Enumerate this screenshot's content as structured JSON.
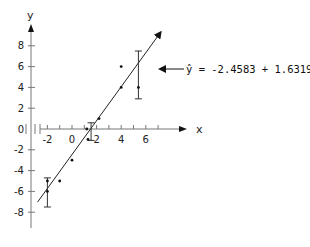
{
  "chart_data": {
    "type": "scatter",
    "title": "",
    "xlabel": "x",
    "ylabel": "y",
    "xlim": [
      -3,
      8
    ],
    "ylim": [
      -10,
      10
    ],
    "grid": false,
    "x_ticks": [
      -2,
      0,
      2,
      4,
      6
    ],
    "x_tick_labels": [
      "-2",
      "0",
      "2",
      "4",
      "6"
    ],
    "y_ticks": [
      8,
      6,
      4,
      2,
      0,
      -2,
      -4,
      -6,
      -8
    ],
    "y_tick_labels": [
      "8",
      "6",
      "4",
      "2",
      "0",
      "-2",
      "-4",
      "-6",
      "-8"
    ],
    "series": [
      {
        "name": "observations",
        "points": [
          {
            "x": -2,
            "y": -5
          },
          {
            "x": -2,
            "y": -6
          },
          {
            "x": -1,
            "y": -5
          },
          {
            "x": 0,
            "y": -3
          },
          {
            "x": 1.2,
            "y": 0
          },
          {
            "x": 1.3,
            "y": -1
          },
          {
            "x": 2.2,
            "y": 1
          },
          {
            "x": 4,
            "y": 4
          },
          {
            "x": 4,
            "y": 6
          },
          {
            "x": 5.4,
            "y": 4
          }
        ]
      }
    ],
    "regression_line": {
      "intercept": -2.4583,
      "slope": 1.6319,
      "x_range": [
        -2.8,
        7.2
      ],
      "label": "ŷ = -2.4583 + 1.6319x"
    },
    "error_bars": [
      {
        "x": -2,
        "y_low": -7.5,
        "y_high": -4.7
      },
      {
        "x": 1.55,
        "y_low": -1.1,
        "y_high": 0.6
      },
      {
        "x": 5.4,
        "y_low": 2.9,
        "y_high": 7.5
      }
    ],
    "annotations": [
      {
        "text": "ŷ = -2.4583 + 1.6319x",
        "points_to": "regression_line"
      }
    ]
  },
  "labels": {
    "x_axis": "x",
    "y_axis": "y",
    "equation": "ŷ = -2.4583 + 1.6319x"
  }
}
